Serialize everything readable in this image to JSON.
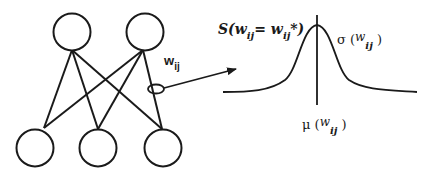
{
  "diagram": {
    "type": "neural-network-weight-distribution",
    "network": {
      "top_nodes": 2,
      "bottom_nodes": 3,
      "connections": "fully connected (each top node to each bottom node)",
      "highlighted_connection": "weight w_ij marked by ellipse on line from right top node to right bottom node"
    },
    "labels": {
      "weight_label": "w",
      "weight_subscript": "ij",
      "distribution_label_prefix": "S(w",
      "distribution_label_sub1": "ij",
      "distribution_label_mid": "= w",
      "distribution_label_sub2": "ij",
      "distribution_label_suffix": "*)",
      "sigma_prefix": "σ (",
      "sigma_w": "w",
      "sigma_sub": "ij",
      "sigma_suffix": ")",
      "mu_prefix": "μ (",
      "mu_w": "w",
      "mu_sub": "ij",
      "mu_suffix": ")"
    },
    "colors": {
      "stroke": "#1a1a1a",
      "background": "#ffffff"
    }
  }
}
